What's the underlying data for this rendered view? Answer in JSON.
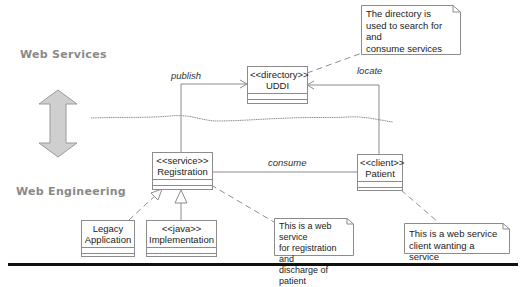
{
  "layers": {
    "top_label": "Web Services",
    "bottom_label": "Web Engineering"
  },
  "classes": {
    "uddi": {
      "stereotype": "<<directory>>",
      "name": "UDDI"
    },
    "registration": {
      "stereotype": "<<service>>",
      "name": "Registration"
    },
    "patient": {
      "stereotype": "<<client>>",
      "name": "Patient"
    },
    "legacy": {
      "line1": "Legacy",
      "line2": "Application"
    },
    "implementation": {
      "stereotype": "<<java>>",
      "name": "Implementation"
    }
  },
  "notes": {
    "directory": "The directory is\nused to search for and\nconsume services",
    "registration": "This is a web service\nfor registration and\ndischarge of patient",
    "client": "This is a web service\nclient wanting a service"
  },
  "edges": {
    "publish": "publish",
    "locate": "locate",
    "consume": "consume"
  },
  "colors": {
    "line": "#8c8c8c",
    "arrow_fill": "#c8c8c8",
    "label_gray": "#8a8a8a",
    "separator": "#111111"
  }
}
